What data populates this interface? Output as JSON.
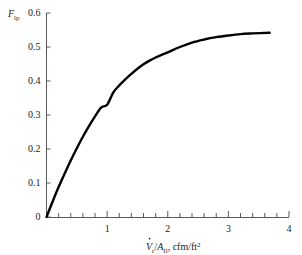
{
  "chart_data": {
    "type": "line",
    "title": "",
    "subtitle": "",
    "xlabel": "V̇r/Afl, cfm/ft2",
    "xlabel_parts": {
      "var": "V",
      "var_dot": "̇",
      "var_sub": "r",
      "divider": "/",
      "denom": "A",
      "denom_sub": "fl",
      "units": ", cfm/ft",
      "units_sup": "2"
    },
    "ylabel": "Flp",
    "ylabel_parts": {
      "var": "F",
      "var_sub": "lp"
    },
    "xlim": [
      0,
      4
    ],
    "ylim": [
      0,
      0.6
    ],
    "xticks": [
      0,
      1,
      2,
      3,
      4
    ],
    "xtick_labels": [
      "",
      "1",
      "2",
      "3",
      "4"
    ],
    "xminor_step": 0.2,
    "yticks": [
      0,
      0.1,
      0.2,
      0.3,
      0.4,
      0.5,
      0.6
    ],
    "ytick_labels": [
      "0",
      "0.1",
      "0.2",
      "0.3",
      "0.4",
      "0.5",
      "0.6"
    ],
    "grid": false,
    "legend": null,
    "series": [
      {
        "name": "Flp",
        "color": "#000000",
        "linewidth": 2.4,
        "x": [
          0,
          0.1,
          0.2,
          0.3,
          0.4,
          0.5,
          0.6,
          0.7,
          0.8,
          0.9,
          1.0,
          1.1,
          1.2,
          1.3,
          1.4,
          1.5,
          1.6,
          1.7,
          1.8,
          1.9,
          2.0,
          2.2,
          2.4,
          2.6,
          2.8,
          3.0,
          3.2,
          3.4,
          3.68
        ],
        "values": [
          0.0,
          0.045,
          0.088,
          0.128,
          0.166,
          0.202,
          0.236,
          0.267,
          0.296,
          0.322,
          0.33,
          0.366,
          0.387,
          0.405,
          0.421,
          0.436,
          0.449,
          0.46,
          0.469,
          0.477,
          0.484,
          0.5,
          0.513,
          0.522,
          0.529,
          0.534,
          0.538,
          0.54,
          0.542
        ]
      }
    ],
    "annotations": [],
    "plateau_value": 0.542,
    "curve_end_x": 3.68
  },
  "figure": {
    "background_color": "#ffffff",
    "axis_color": "#5a5a5a",
    "curve_color": "#000000"
  }
}
